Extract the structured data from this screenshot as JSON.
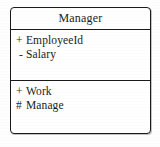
{
  "diagram": {
    "type": "uml-class-diagram",
    "class_box": {
      "name": "Manager",
      "attributes": [
        {
          "visibility": "+",
          "name": "EmployeeId"
        },
        {
          "visibility": "-",
          "name": "Salary"
        }
      ],
      "operations": [
        {
          "visibility": "+",
          "name": "Work"
        },
        {
          "visibility": "#",
          "name": "Manage"
        }
      ]
    },
    "colors": {
      "border": "#1a1a1a",
      "text": "#1b1b1b",
      "background": "#ffffff"
    }
  }
}
